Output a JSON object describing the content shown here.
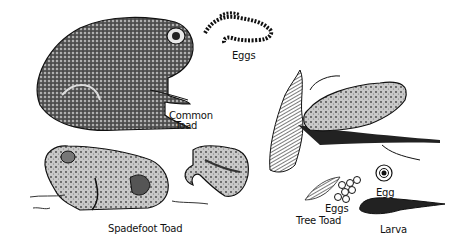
{
  "illustration": {
    "subject": "Toads and their eggs and larva",
    "palette": {
      "ink": "#111111",
      "paper": "#ffffff",
      "mid": "#6a6a6a",
      "light": "#bdbdbd"
    },
    "labels": {
      "common_toad_line1": "Common",
      "common_toad_line2": "Toad",
      "common_eggs": "Eggs",
      "spadefoot_toad": "Spadefoot Toad",
      "tree_toad": "Tree Toad",
      "tree_eggs": "Eggs",
      "egg": "Egg",
      "larva": "Larva"
    },
    "figures": [
      "common-toad",
      "common-toad-egg-string",
      "spadefoot-toad",
      "spadefoot-hind-foot",
      "tree-toad-on-branch",
      "tree-toad-egg-cluster",
      "single-egg",
      "larva"
    ]
  }
}
